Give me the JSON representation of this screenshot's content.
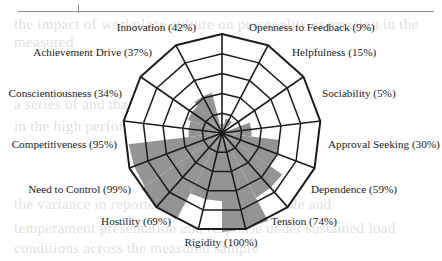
{
  "figure": {
    "background": "#ffffff",
    "rule_color": "#8d8d8d",
    "bleed_lines": [
      {
        "text": "the impact of workplace culture on personality expression in the",
        "top": 16,
        "left": 14
      },
      {
        "text": "measured",
        "top": 34,
        "left": 14
      },
      {
        "text": "a series of and that and the particular analysis",
        "top": 96,
        "left": 14
      },
      {
        "text": "in the high performing teams of the organisation",
        "top": 118,
        "left": 14
      },
      {
        "text": "the variance in reported scores is considerable and",
        "top": 196,
        "left": 14
      },
      {
        "text": "temperament presentation and response under sustained load",
        "top": 220,
        "left": 14
      },
      {
        "text": "conditions across the measured sample",
        "top": 240,
        "left": 14
      }
    ]
  },
  "chart_data": {
    "type": "radar",
    "title": "",
    "subtitle": "",
    "xlabel": "",
    "ylabel": "",
    "value_unit": "%",
    "rlim": [
      0,
      100
    ],
    "rings": 5,
    "ring_values": [
      20,
      40,
      60,
      80,
      100
    ],
    "grid": true,
    "legend": "none",
    "fill_color": "#949494",
    "line_color": "#1c1c1c",
    "categories": [
      "Openness to Feedback",
      "Helpfulness",
      "Sociability",
      "Approval Seeking",
      "Dependence",
      "Tension",
      "Rigidity",
      "Hostility",
      "Need to Control",
      "Competitiveness",
      "Conscientiousness",
      "Achievement Drive",
      "Innovation"
    ],
    "values": [
      9,
      15,
      5,
      30,
      59,
      74,
      100,
      69,
      99,
      95,
      34,
      37,
      42
    ],
    "labels": [
      "Openness to Feedback (9%)",
      "Helpfulness (15%)",
      "Sociability (5%)",
      "Approval Seeking (30%)",
      "Dependence (59%)",
      "Tension (74%)",
      "Rigidity (100%)",
      "Hostility (69%)",
      "Need to Control (99%)",
      "Competitiveness (95%)",
      "Conscientiousness (34%)",
      "Achievement Drive (37%)",
      "Innovation (42%)"
    ]
  }
}
